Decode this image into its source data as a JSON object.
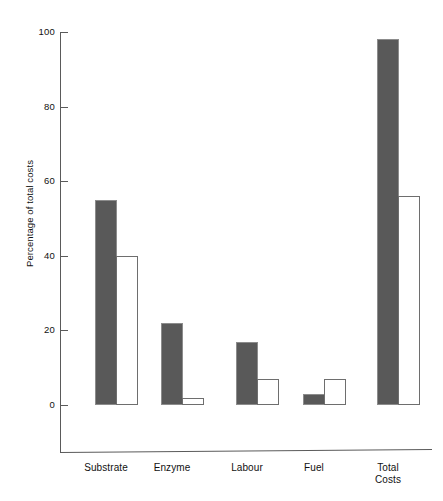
{
  "chart_data": {
    "type": "bar",
    "title": "",
    "subtitle": "",
    "xlabel": "",
    "ylabel": "Percentage of total costs",
    "ylim": [
      0,
      100
    ],
    "yticks": [
      0,
      20,
      40,
      60,
      80,
      100
    ],
    "ytick_labels": [
      "0",
      "20",
      "40",
      "60",
      "80",
      "100"
    ],
    "grid": false,
    "legend": "none",
    "categories": [
      "Substrate",
      "Enzyme",
      "Labour",
      "Fuel",
      "Total\nCosts"
    ],
    "series": [
      {
        "name": "filled",
        "style": "solid-dark",
        "color": "#595959",
        "values": [
          55,
          22,
          17,
          3,
          98
        ]
      },
      {
        "name": "open",
        "style": "outline-white",
        "color": "#ffffff",
        "values": [
          40,
          2,
          7,
          7,
          56
        ]
      }
    ]
  },
  "axis": {
    "y_title": "Percentage of total costs",
    "ticks": [
      {
        "label": "100",
        "value": 100
      },
      {
        "label": "80",
        "value": 80
      },
      {
        "label": "60",
        "value": 60
      },
      {
        "label": "40",
        "value": 40
      },
      {
        "label": "20",
        "value": 20
      },
      {
        "label": "0",
        "value": 0
      }
    ]
  },
  "categories": [
    {
      "label": "Substrate"
    },
    {
      "label": "Enzyme"
    },
    {
      "label": "Labour"
    },
    {
      "label": "Fuel"
    },
    {
      "label": "Total\nCosts"
    }
  ],
  "colors": {
    "filled_bar": "#595959",
    "open_bar_border": "#6e6e6e",
    "axis": "#5a5a5a",
    "text": "#111111",
    "background": "#ffffff"
  }
}
